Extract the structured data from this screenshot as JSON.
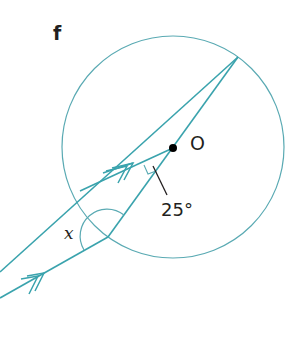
{
  "diagram": {
    "part_label": "f",
    "center_label": "O",
    "given_angle_label": "25°",
    "unknown_angle_label": "x",
    "colors": {
      "line": "#3aa3ad",
      "circle": "#5aaab3",
      "text": "#231f20",
      "center_dot": "#000000"
    },
    "elements": [
      "circle with centre O",
      "diameter from point on circle through O",
      "chord from top point of circle extending outside the circle",
      "line from O parallel to lower line (double arrow marks)",
      "lower line from vertex outside (double arrow marks)",
      "angle 25° at vertex between parallel line and diameter",
      "angle x at lower vertex"
    ]
  }
}
